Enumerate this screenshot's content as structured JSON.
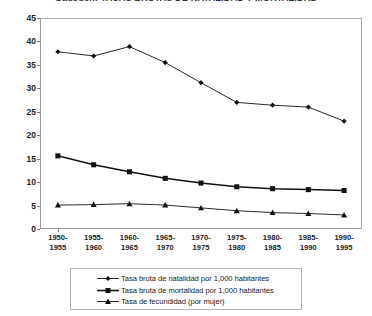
{
  "chart_data": {
    "type": "line",
    "title": "Gadsden: TASAS BRUTAS DE NATALIDAD Y MORTALIDAD",
    "xlabel": "",
    "ylabel": "",
    "ylim": [
      0,
      45
    ],
    "ytick_step": 5,
    "yticks": [
      "45",
      "40",
      "35",
      "30",
      "25",
      "20",
      "15",
      "10",
      "5",
      "0"
    ],
    "grid": false,
    "legend_position": "bottom",
    "categories": [
      "1950-\n1955",
      "1955-\n1960",
      "1960-\n1965",
      "1965-\n1970",
      "1970-\n1975",
      "1975-\n1980",
      "1980-\n1985",
      "1985-\n1990",
      "1990-\n1995"
    ],
    "categories_lines": [
      [
        "1950-",
        "1955"
      ],
      [
        "1955-",
        "1960"
      ],
      [
        "1960-",
        "1965"
      ],
      [
        "1965-",
        "1970"
      ],
      [
        "1970-",
        "1975"
      ],
      [
        "1975-",
        "1980"
      ],
      [
        "1980-",
        "1985"
      ],
      [
        "1985-",
        "1990"
      ],
      [
        "1990-",
        "1995"
      ]
    ],
    "series": [
      {
        "name": "Tasa bruta de natalidad por 1,000 habitantes",
        "marker": "diamond",
        "color": "#111111",
        "values": [
          37.8,
          36.9,
          38.9,
          35.5,
          31.2,
          27.0,
          26.4,
          26.0,
          23.0
        ]
      },
      {
        "name": "Tasa bruta de mortalidad por 1,000 habitantes",
        "marker": "square",
        "color": "#111111",
        "values": [
          15.6,
          13.7,
          12.2,
          10.8,
          9.8,
          9.0,
          8.6,
          8.4,
          8.2
        ]
      },
      {
        "name": "Tasa de fecundidad (por mujer)",
        "marker": "triangle",
        "color": "#111111",
        "values": [
          5.1,
          5.2,
          5.4,
          5.1,
          4.5,
          3.9,
          3.5,
          3.3,
          3.0
        ]
      }
    ]
  }
}
